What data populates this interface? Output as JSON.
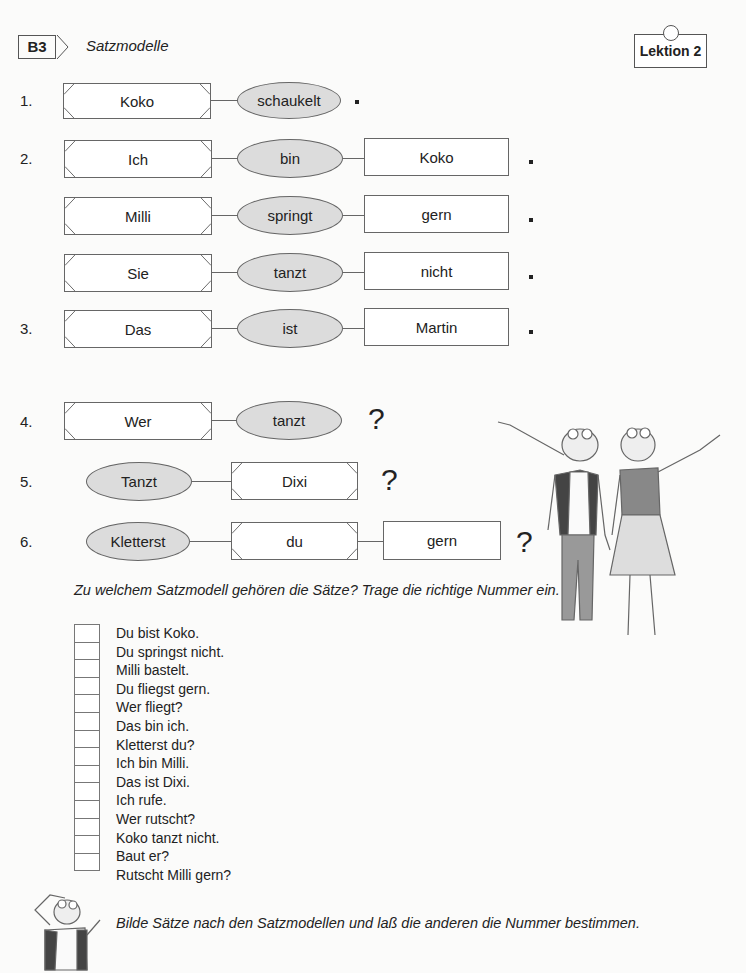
{
  "header": {
    "section_tag": "B3",
    "section_title": "Satzmodelle",
    "lesson_label": "Lektion 2"
  },
  "models": [
    {
      "number": "1.",
      "parts": [
        "Koko",
        "schaukelt"
      ],
      "end": "."
    },
    {
      "number": "2.",
      "rows": [
        {
          "parts": [
            "Ich",
            "bin",
            "Koko"
          ],
          "end": "."
        },
        {
          "parts": [
            "Milli",
            "springt",
            "gern"
          ],
          "end": "."
        },
        {
          "parts": [
            "Sie",
            "tanzt",
            "nicht"
          ],
          "end": "."
        }
      ]
    },
    {
      "number": "3.",
      "parts": [
        "Das",
        "ist",
        "Martin"
      ],
      "end": "."
    },
    {
      "number": "4.",
      "parts": [
        "Wer",
        "tanzt"
      ],
      "end": "?"
    },
    {
      "number": "5.",
      "parts": [
        "Tanzt",
        "Dixi"
      ],
      "end": "?"
    },
    {
      "number": "6.",
      "parts": [
        "Kletterst",
        "du",
        "gern"
      ],
      "end": "?"
    }
  ],
  "exercise": {
    "instruction": "Zu welchem Satzmodell gehören die Sätze? Trage die richtige Nummer ein.",
    "sentences": [
      "Du bist Koko.",
      "Du springst nicht.",
      "Milli bastelt.",
      "Du fliegst gern.",
      "Wer fliegt?",
      "Das bin ich.",
      "Kletterst du?",
      "Ich bin Milli.",
      "Das ist Dixi.",
      "Ich rufe.",
      "Wer rutscht?",
      "Koko tanzt nicht.",
      "Baut er?",
      "Rutscht Milli gern?"
    ],
    "answers": [
      "",
      "",
      "",
      "",
      "",
      "",
      "",
      "",
      "",
      "",
      "",
      "",
      "",
      ""
    ]
  },
  "footer": {
    "instruction": "Bilde Sätze nach den Satzmodellen und laß die anderen die Nummer bestimmen."
  },
  "illustrations": {
    "main": "two-frog-characters-waving",
    "small": "frog-character-thinking"
  },
  "colors": {
    "ellipse_fill": "#dcdcdc",
    "border": "#666666",
    "text": "#222222"
  }
}
